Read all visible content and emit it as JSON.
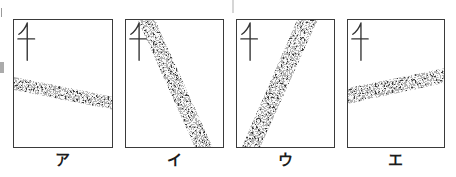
{
  "figure": {
    "description_labels_only": "",
    "colors": {
      "outline": "#3a3a3a",
      "label_text": "#1b1b1b",
      "background": "#ffffff"
    },
    "north_icon": "north-arrow-map-symbol"
  },
  "panels": [
    {
      "label": "ア",
      "band_points": "0,58 100,78 100,91 0,71"
    },
    {
      "label": "イ",
      "band_points": "12,0 30,0 89,129 71,129"
    },
    {
      "label": "ウ",
      "band_points": "62,0 83,0 24,129 5,129"
    },
    {
      "label": "エ",
      "band_points": "0,69 100,49 100,64 0,85"
    }
  ]
}
